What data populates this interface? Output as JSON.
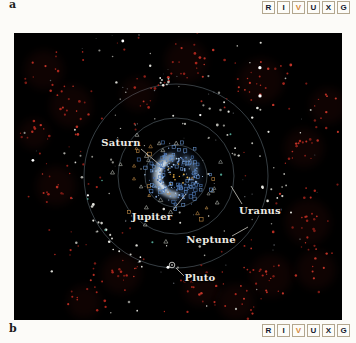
{
  "figure": {
    "panel_label_top": "a",
    "panel_label_bottom": "b",
    "wavelength_key": {
      "letters": [
        "R",
        "I",
        "V",
        "U",
        "X",
        "G"
      ],
      "active_letter": "V",
      "active_color": "#d4873b",
      "inactive_color": "#141830"
    }
  },
  "diagram": {
    "seed": 7,
    "center": {
      "x": 162,
      "y": 143
    },
    "orbit_color": "#8da4b0",
    "orbits": [
      {
        "name": "jupiter-orbit",
        "r": 17,
        "opacity": 0.3
      },
      {
        "name": "saturn-orbit",
        "r": 31,
        "opacity": 0.55
      },
      {
        "name": "uranus-orbit",
        "r": 58,
        "opacity": 0.55
      },
      {
        "name": "neptune-orbit",
        "r": 92,
        "opacity": 0.55
      }
    ],
    "glows": [
      {
        "r": 19,
        "w": 16,
        "a0": 0,
        "a1": 359.9,
        "color": "#3d5f8e",
        "opacity": 0.22,
        "blur": "b6"
      },
      {
        "r": 19,
        "w": 8,
        "a0": 95,
        "a1": 255,
        "color": "#c6daec",
        "opacity": 0.65,
        "blur": "b3"
      },
      {
        "r": 17,
        "w": 4,
        "a0": 130,
        "a1": 230,
        "color": "#eaf3fa",
        "opacity": 0.8,
        "blur": "b2"
      },
      {
        "r": 20,
        "w": 6,
        "a0": 300,
        "a1": 345,
        "color": "#8fb0d0",
        "opacity": 0.35,
        "blur": "b3"
      }
    ],
    "labels": [
      {
        "text": "Saturn",
        "x": 107,
        "y": 113,
        "line": [
          127,
          116,
          146,
          132
        ]
      },
      {
        "text": "Jupiter",
        "x": 138,
        "y": 187,
        "line": [
          159,
          177,
          172,
          161
        ]
      },
      {
        "text": "Uranus",
        "x": 246,
        "y": 181,
        "line": [
          228,
          171,
          217,
          153
        ]
      },
      {
        "text": "Neptune",
        "x": 197,
        "y": 210,
        "line": [
          218,
          203,
          234,
          194
        ]
      },
      {
        "text": "Pluto",
        "x": 186,
        "y": 248,
        "line": [
          170,
          243,
          162,
          235
        ]
      }
    ],
    "pluto_marker": {
      "x": 158,
      "y": 232,
      "r": 2.8
    },
    "scatter_layers": [
      {
        "name": "red-kbo-clusters",
        "shape": "dot",
        "mode": "clusters",
        "haze": true,
        "colors": [
          "#a8251c",
          "#8f1f18",
          "#c03428",
          "#7a1a14",
          "#b52d22"
        ],
        "size": [
          0.7,
          1.4
        ],
        "clusters": [
          [
            10,
            -115,
            20,
            14
          ],
          [
            85,
            -95,
            24,
            15
          ],
          [
            128,
            -28,
            16,
            13
          ],
          [
            132,
            46,
            22,
            15
          ],
          [
            95,
            100,
            20,
            14
          ],
          [
            25,
            112,
            15,
            12
          ],
          [
            -55,
            98,
            17,
            13
          ],
          [
            -120,
            10,
            15,
            13
          ],
          [
            -105,
            -70,
            18,
            14
          ],
          [
            -38,
            -82,
            11,
            11
          ],
          [
            152,
            -70,
            11,
            12
          ],
          [
            -142,
            -42,
            9,
            10
          ],
          [
            60,
            126,
            11,
            12
          ],
          [
            -92,
            126,
            9,
            11
          ],
          [
            -132,
            -106,
            10,
            13
          ],
          [
            140,
            94,
            11,
            13
          ]
        ]
      },
      {
        "name": "red-kbo-scatter",
        "shape": "dot",
        "mode": "annulus",
        "n": 60,
        "colors": [
          "#a8251c",
          "#8f1f18",
          "#7a1a14"
        ],
        "size": [
          0.6,
          1.2
        ],
        "rmin": 62,
        "rmax": 165
      },
      {
        "name": "white-cluster",
        "shape": "dot",
        "mode": "clusters",
        "colors": [
          "#e8e8e2",
          "#cfcfc8",
          "#b5b5ae"
        ],
        "size": [
          0.8,
          1.4
        ],
        "clusters": [
          [
            55,
            -55,
            13,
            20
          ],
          [
            -15,
            -96,
            7,
            6
          ],
          [
            95,
            20,
            8,
            7
          ]
        ]
      },
      {
        "name": "white-arc-chain",
        "shape": "dot",
        "mode": "arc",
        "n": 16,
        "colors": [
          "#e4e4de",
          "#c8c8c2"
        ],
        "size": [
          0.8,
          1.5
        ],
        "r": 92,
        "rjit": 5,
        "a0": 110,
        "a1": 170
      },
      {
        "name": "white-scatter",
        "shape": "dot",
        "mode": "annulus",
        "n": 75,
        "colors": [
          "#d8d8d2",
          "#a8a8a2",
          "#8a8a85"
        ],
        "size": [
          0.6,
          1.3
        ],
        "rmin": 35,
        "rmax": 160
      },
      {
        "name": "bright-white",
        "shape": "dot",
        "mode": "annulus",
        "n": 7,
        "colors": [
          "#ffffff"
        ],
        "size": [
          1.1,
          1.7
        ],
        "rmin": 60,
        "rmax": 150
      },
      {
        "name": "gray-triangles",
        "shape": "triangle",
        "mode": "annulus",
        "n": 22,
        "colors": [
          "#b8bcb4",
          "#9aa09a"
        ],
        "size": [
          1.7,
          2.5
        ],
        "rmin": 26,
        "rmax": 70
      },
      {
        "name": "tan-triangles",
        "shape": "triangle",
        "mode": "annulus",
        "n": 9,
        "colors": [
          "#c08a45",
          "#d09a50"
        ],
        "size": [
          1.5,
          2.1
        ],
        "rmin": 16,
        "rmax": 58
      },
      {
        "name": "tan-squares",
        "shape": "square",
        "mode": "annulus",
        "n": 6,
        "colors": [
          "#c08a45"
        ],
        "size": [
          1.4,
          2.0
        ],
        "rmin": 18,
        "rmax": 60
      },
      {
        "name": "blue-ring-dots",
        "shape": "dot",
        "mode": "gauss-ring",
        "n": 170,
        "colors": [
          "#5d86c2",
          "#7fa3d6",
          "#a9c7e8",
          "#4a6fae"
        ],
        "size": [
          0.45,
          1.0
        ],
        "r": 18,
        "sigma": 5,
        "rmin": 7,
        "rmax": 32
      },
      {
        "name": "blue-open-squares",
        "shape": "square",
        "mode": "gauss-ring",
        "n": 65,
        "colors": [
          "#4d78b5",
          "#6590c8"
        ],
        "size": [
          1.1,
          1.8
        ],
        "r": 22,
        "sigma": 9,
        "rmin": 9,
        "rmax": 46
      },
      {
        "name": "center-orange-dots",
        "shape": "dot",
        "mode": "annulus",
        "n": 11,
        "colors": [
          "#cf9a3a",
          "#e0b050"
        ],
        "size": [
          0.6,
          1.1
        ],
        "rmin": 2,
        "rmax": 14
      },
      {
        "name": "teal-dots",
        "shape": "dot",
        "mode": "annulus",
        "n": 6,
        "colors": [
          "#4fa08f"
        ],
        "size": [
          0.8,
          1.2
        ],
        "rmin": 45,
        "rmax": 115
      },
      {
        "name": "faint-specks",
        "shape": "dot",
        "mode": "annulus",
        "n": 45,
        "colors": [
          "#666a70",
          "#55585e"
        ],
        "size": [
          0.4,
          0.8
        ],
        "rmin": 20,
        "rmax": 165
      }
    ]
  }
}
